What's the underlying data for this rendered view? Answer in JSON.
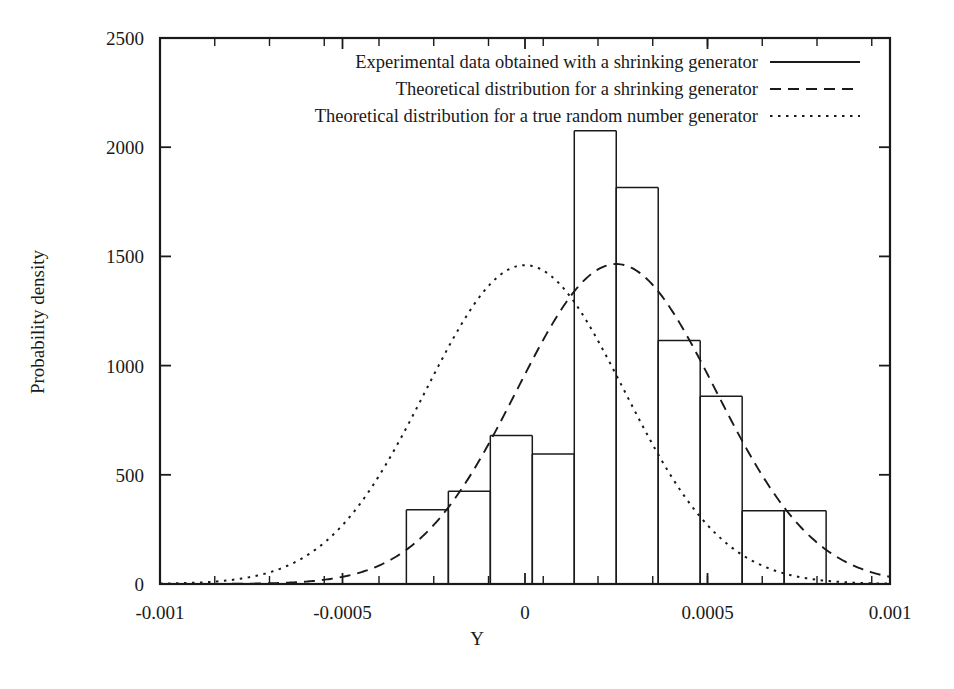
{
  "chart_data": {
    "type": "bar",
    "title": "",
    "xlabel": "Y",
    "ylabel": "Probability density",
    "xlim": [
      -0.001,
      0.001
    ],
    "ylim": [
      0,
      2500
    ],
    "grid": false,
    "legend_position": "top-center-inside",
    "x_ticks": [
      {
        "value": -0.001,
        "label": "-0.001"
      },
      {
        "value": -0.0005,
        "label": "-0.0005"
      },
      {
        "value": 0,
        "label": "0"
      },
      {
        "value": 0.0005,
        "label": "0.0005"
      },
      {
        "value": 0.001,
        "label": "0.001"
      }
    ],
    "x_minor_ticks": [
      -0.00085,
      -0.0007,
      -0.00055,
      -0.0004,
      -0.00025,
      -0.0001,
      5e-05,
      0.0002,
      0.00035,
      0.0005,
      0.00065,
      0.0008,
      0.00095
    ],
    "y_ticks": [
      {
        "value": 0,
        "label": "0"
      },
      {
        "value": 500,
        "label": "500"
      },
      {
        "value": 1000,
        "label": "1000"
      },
      {
        "value": 1500,
        "label": "1500"
      },
      {
        "value": 2000,
        "label": "2000"
      },
      {
        "value": 2500,
        "label": "2500"
      }
    ],
    "series": [
      {
        "name": "Experimental data obtained with a shrinking generator",
        "style": "solid",
        "type": "histogram",
        "bin_width": 0.000115,
        "bins": [
          {
            "x_start": -0.000325,
            "x_end": -0.00021,
            "value": 340
          },
          {
            "x_start": -0.00021,
            "x_end": -9.5e-05,
            "value": 425
          },
          {
            "x_start": -9.5e-05,
            "x_end": 2e-05,
            "value": 680
          },
          {
            "x_start": 2e-05,
            "x_end": 0.000135,
            "value": 595
          },
          {
            "x_start": 0.000135,
            "x_end": 0.00025,
            "value": 2075
          },
          {
            "x_start": 0.00025,
            "x_end": 0.000365,
            "value": 1815
          },
          {
            "x_start": 0.000365,
            "x_end": 0.00048,
            "value": 1115
          },
          {
            "x_start": 0.00048,
            "x_end": 0.000595,
            "value": 860
          },
          {
            "x_start": 0.000595,
            "x_end": 0.00071,
            "value": 335
          },
          {
            "x_start": 0.00071,
            "x_end": 0.000825,
            "value": 335
          }
        ]
      },
      {
        "name": "Theoretical distribution for a shrinking generator",
        "style": "dashed",
        "type": "gaussian",
        "mean": 0.00025,
        "sigma": 0.000272,
        "peak": 1465
      },
      {
        "name": "Theoretical distribution for a true random number generator",
        "style": "dotted",
        "type": "gaussian",
        "mean": 0.0,
        "sigma": 0.000272,
        "peak": 1460
      }
    ]
  },
  "legend": {
    "entries": [
      {
        "label": "Experimental data obtained with a shrinking generator",
        "style": "solid"
      },
      {
        "label": "Theoretical distribution for a shrinking generator",
        "style": "dashed"
      },
      {
        "label": "Theoretical distribution for a true random number generator",
        "style": "dotted"
      }
    ]
  }
}
